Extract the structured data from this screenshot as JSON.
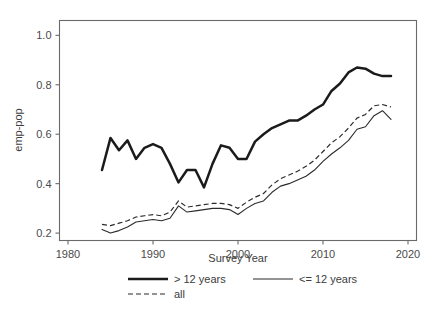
{
  "chart_data": {
    "type": "line",
    "title": "",
    "xlabel": "Survey Year",
    "ylabel": "emp-pop",
    "xlim": [
      1979,
      2021
    ],
    "ylim": [
      0.17,
      1.06
    ],
    "grid": false,
    "legend_position": "below",
    "xticks": [
      1980,
      1990,
      2000,
      2010,
      2020
    ],
    "xtick_labels": [
      "1980",
      "1990",
      "2000",
      "2010",
      "2020"
    ],
    "yticks": [
      0.2,
      0.4,
      0.6,
      0.8,
      1.0
    ],
    "ytick_labels": [
      "0.2",
      "0.4",
      "0.6",
      "0.8",
      "1.0"
    ],
    "x": [
      1984,
      1985,
      1986,
      1987,
      1988,
      1989,
      1990,
      1991,
      1992,
      1993,
      1994,
      1995,
      1996,
      1997,
      1998,
      1999,
      2000,
      2001,
      2002,
      2003,
      2004,
      2005,
      2006,
      2007,
      2008,
      2009,
      2010,
      2011,
      2012,
      2013,
      2014,
      2015,
      2016,
      2017,
      2018
    ],
    "series": [
      {
        "name": "> 12 years",
        "style": "thick-solid",
        "values": [
          0.455,
          0.585,
          0.535,
          0.575,
          0.5,
          0.545,
          0.56,
          0.545,
          0.48,
          0.405,
          0.455,
          0.455,
          0.385,
          0.48,
          0.555,
          0.545,
          0.5,
          0.5,
          0.57,
          0.6,
          0.625,
          0.64,
          0.655,
          0.655,
          0.675,
          0.7,
          0.72,
          0.775,
          0.805,
          0.85,
          0.87,
          0.865,
          0.845,
          0.835,
          0.835
        ]
      },
      {
        "name": "<= 12 years",
        "style": "thin-solid",
        "values": [
          0.215,
          0.2,
          0.21,
          0.225,
          0.245,
          0.25,
          0.255,
          0.25,
          0.26,
          0.31,
          0.285,
          0.29,
          0.295,
          0.3,
          0.3,
          0.295,
          0.275,
          0.3,
          0.32,
          0.33,
          0.365,
          0.39,
          0.4,
          0.415,
          0.43,
          0.455,
          0.49,
          0.52,
          0.545,
          0.575,
          0.62,
          0.63,
          0.675,
          0.695,
          0.66
        ]
      },
      {
        "name": "all",
        "style": "dashed",
        "values": [
          0.235,
          0.23,
          0.24,
          0.25,
          0.265,
          0.27,
          0.275,
          0.27,
          0.285,
          0.33,
          0.305,
          0.31,
          0.315,
          0.32,
          0.32,
          0.315,
          0.3,
          0.325,
          0.345,
          0.36,
          0.395,
          0.42,
          0.435,
          0.45,
          0.47,
          0.495,
          0.53,
          0.565,
          0.59,
          0.625,
          0.665,
          0.68,
          0.715,
          0.72,
          0.71
        ]
      }
    ],
    "legend": [
      {
        "label": "> 12 years",
        "style": "thick-solid"
      },
      {
        "label": "<= 12 years",
        "style": "thin-solid"
      },
      {
        "label": "all",
        "style": "dashed"
      }
    ]
  }
}
